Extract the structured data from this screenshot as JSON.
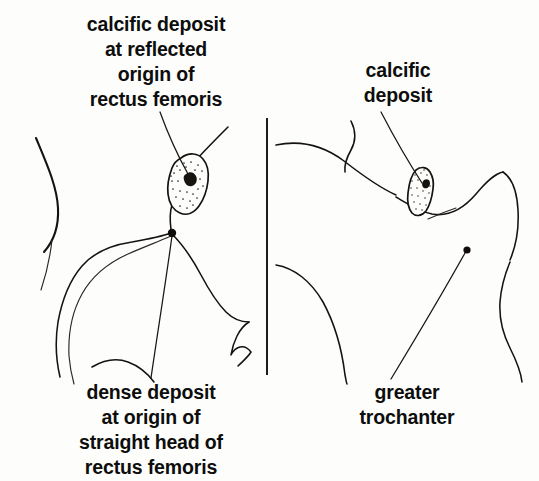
{
  "figure": {
    "kind": "anatomical-line-drawing",
    "background_color": "#fdfdfb",
    "ink_color": "#15120f",
    "panel_count": 2
  },
  "labels": {
    "left_top": "calcific deposit\nat reflected\norigin of\nrectus femoris",
    "left_bottom": "dense deposit\nat origin of\nstraight head of\nrectus femoris",
    "right_top": "calcific\ndeposit",
    "right_bottom": "greater\ntrochanter"
  },
  "panels": [
    {
      "id": "left-panel",
      "name": "anteroposterior hip with reflected-head deposit",
      "annotations": [
        {
          "target": "calcific deposit at reflected origin of rectus femoris",
          "marker": "stippled-blob",
          "marker_center": [
            186,
            186
          ]
        },
        {
          "target": "dense deposit at origin of straight head of rectus femoris",
          "marker": "solid-dot",
          "marker_center": [
            172,
            233
          ]
        }
      ]
    },
    {
      "id": "right-panel",
      "name": "lateral hip with greater trochanter",
      "annotations": [
        {
          "target": "calcific deposit",
          "marker": "stippled-blob",
          "marker_center": [
            424,
            192
          ]
        },
        {
          "target": "greater trochanter",
          "marker": "solid-dot",
          "marker_center": [
            467,
            250
          ]
        }
      ]
    }
  ],
  "divider": {
    "orientation": "vertical",
    "x": 267,
    "y_start": 118,
    "y_end": 375
  }
}
